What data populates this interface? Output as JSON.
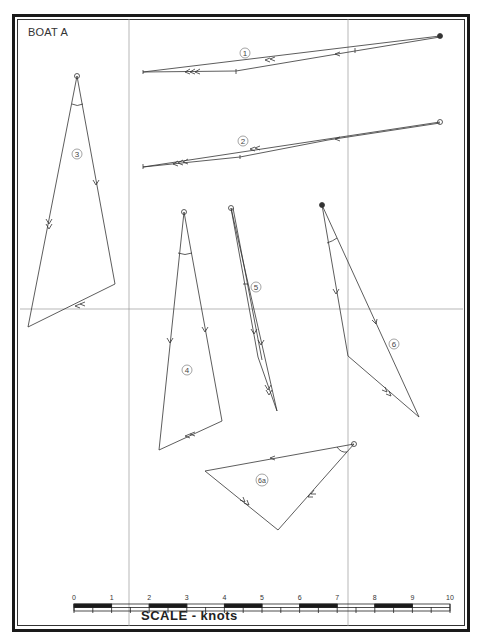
{
  "title": "BOAT A",
  "scale": {
    "label": "SCALE - knots",
    "ticks": [
      "0",
      "1",
      "2",
      "3",
      "4",
      "5",
      "6",
      "7",
      "8",
      "9",
      "10"
    ]
  },
  "diagrams": [
    {
      "id": "1",
      "label": "1"
    },
    {
      "id": "2",
      "label": "2"
    },
    {
      "id": "3",
      "label": "3"
    },
    {
      "id": "4",
      "label": "4"
    },
    {
      "id": "5",
      "label": "5"
    },
    {
      "id": "6",
      "label": "6"
    },
    {
      "id": "6a",
      "label": "6a"
    }
  ],
  "colors": {
    "line": "#333333",
    "grid": "#9a9a9a",
    "frame": "#1a1a1a",
    "bar_fill": "#1a1a1a"
  }
}
